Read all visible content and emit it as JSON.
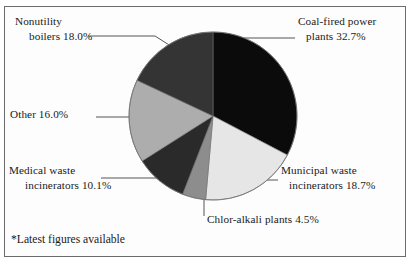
{
  "figure": {
    "footnote": "*Latest figures available",
    "frame_color": "#6b6b6b",
    "background": "#ffffff"
  },
  "chart_data": {
    "type": "pie",
    "title": "",
    "subtitle": "",
    "xlabel": "",
    "ylabel": "",
    "legend_position": "none",
    "labels_position": "outside-with-leader-lines",
    "grid": false,
    "start_angle_deg": 0,
    "direction": "clockwise",
    "units": "percent",
    "total": 100.0,
    "categories": [
      "Coal-fired power plants",
      "Municipal waste incinerators",
      "Chlor-alkali plants",
      "Medical waste incinerators",
      "Other",
      "Nonutility boilers"
    ],
    "values": [
      32.7,
      18.7,
      4.5,
      10.1,
      16.0,
      18.0
    ],
    "slices": [
      {
        "name": "coal-fired-power-plants",
        "label_line1": "Coal-fired power",
        "label_line2": "plants 32.7%",
        "value": 32.7,
        "value_text": "32.7%",
        "color": "#0b0b0b",
        "start_deg": 0,
        "end_deg": 117.72
      },
      {
        "name": "municipal-waste-incinerators",
        "label_line1": "Municipal waste",
        "label_line2": "incinerators 18.7%",
        "value": 18.7,
        "value_text": "18.7%",
        "color": "#e6e6e6",
        "start_deg": 117.72,
        "end_deg": 185.04
      },
      {
        "name": "chlor-alkali-plants",
        "label_line1": "Chlor-alkali plants 4.5%",
        "label_line2": "",
        "value": 4.5,
        "value_text": "4.5%",
        "color": "#8d8d8d",
        "start_deg": 185.04,
        "end_deg": 201.24
      },
      {
        "name": "medical-waste-incinerators",
        "label_line1": "Medical waste",
        "label_line2": "incinerators 10.1%",
        "value": 10.1,
        "value_text": "10.1%",
        "color": "#2a2a2a",
        "start_deg": 201.24,
        "end_deg": 237.6
      },
      {
        "name": "other",
        "label_line1": "Other 16.0%",
        "label_line2": "",
        "value": 16.0,
        "value_text": "16.0%",
        "color": "#adadad",
        "start_deg": 237.6,
        "end_deg": 295.2
      },
      {
        "name": "nonutility-boilers",
        "label_line1": "Nonutility",
        "label_line2": "boilers 18.0%",
        "value": 18.0,
        "value_text": "18.0%",
        "color": "#343434",
        "start_deg": 295.2,
        "end_deg": 360
      }
    ]
  }
}
